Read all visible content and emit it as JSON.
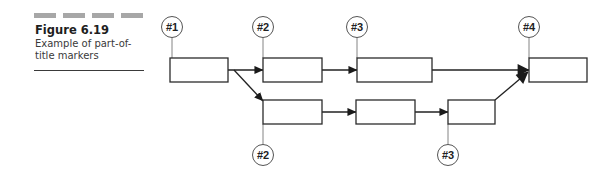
{
  "caption": {
    "dash_count": 4,
    "title": "Figure 6.19",
    "description_line1": "Example of part-of-",
    "description_line2": "title markers"
  },
  "colors": {
    "dash": "#a7a7a7",
    "stroke": "#2b2b2b",
    "text": "#1e1e1e"
  },
  "diagram": {
    "boxes": [
      {
        "id": "b1",
        "x": 170,
        "y": 58,
        "w": 58,
        "h": 24
      },
      {
        "id": "b2",
        "x": 263,
        "y": 58,
        "w": 59,
        "h": 24
      },
      {
        "id": "b3",
        "x": 357,
        "y": 58,
        "w": 75,
        "h": 24
      },
      {
        "id": "b4",
        "x": 529,
        "y": 58,
        "w": 58,
        "h": 24
      },
      {
        "id": "b5",
        "x": 263,
        "y": 100,
        "w": 59,
        "h": 24
      },
      {
        "id": "b6",
        "x": 356,
        "y": 100,
        "w": 59,
        "h": 24
      },
      {
        "id": "b7",
        "x": 448,
        "y": 100,
        "w": 47,
        "h": 24
      }
    ],
    "markers": [
      {
        "label": "#1",
        "cx": 172,
        "cy": 27,
        "line_to_y": 58
      },
      {
        "label": "#2",
        "cx": 263,
        "cy": 27,
        "line_to_y": 58
      },
      {
        "label": "#3",
        "cx": 357,
        "cy": 27,
        "line_to_y": 58
      },
      {
        "label": "#4",
        "cx": 529,
        "cy": 27,
        "line_to_y": 58
      },
      {
        "label": "#2",
        "cx": 263,
        "cy": 155,
        "line_to_y": 124
      },
      {
        "label": "#3",
        "cx": 448,
        "cy": 155,
        "line_to_y": 124
      }
    ],
    "arrows": [
      {
        "from": "b1",
        "to": "b2",
        "x1": 228,
        "y1": 70,
        "x2": 263,
        "y2": 70
      },
      {
        "from": "b1",
        "to": "b5",
        "x1": 234,
        "y1": 70,
        "x2": 263,
        "y2": 101
      },
      {
        "from": "b2",
        "to": "b3",
        "x1": 322,
        "y1": 70,
        "x2": 357,
        "y2": 70
      },
      {
        "from": "b3",
        "to": "b4",
        "x1": 432,
        "y1": 70,
        "x2": 529,
        "y2": 70
      },
      {
        "from": "b5",
        "to": "b6",
        "x1": 322,
        "y1": 112,
        "x2": 356,
        "y2": 112
      },
      {
        "from": "b6",
        "to": "b7",
        "x1": 415,
        "y1": 112,
        "x2": 448,
        "y2": 112
      },
      {
        "from": "b7",
        "to": "b4",
        "x1": 495,
        "y1": 100,
        "x2": 528,
        "y2": 72
      }
    ]
  }
}
